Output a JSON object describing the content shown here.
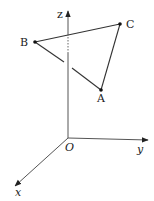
{
  "diagram": {
    "type": "3d-coordinate-system-with-triangle",
    "axes": {
      "x": {
        "label": "x"
      },
      "y": {
        "label": "y"
      },
      "z": {
        "label": "z"
      },
      "origin": {
        "label": "O"
      }
    },
    "points": [
      {
        "id": "A",
        "label": "A"
      },
      {
        "id": "B",
        "label": "B"
      },
      {
        "id": "C",
        "label": "C"
      }
    ],
    "edges": [
      "AB",
      "BC",
      "CA"
    ],
    "colors": {
      "line": "#333333",
      "axis": "#555555",
      "background": "#ffffff"
    }
  }
}
